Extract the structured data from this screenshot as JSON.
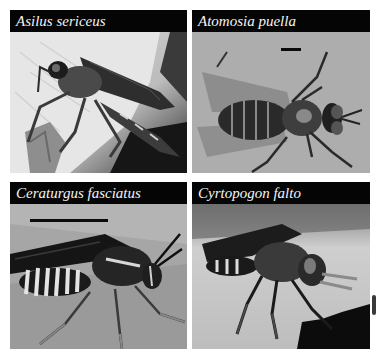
{
  "figure": {
    "panels": [
      {
        "id": "asilus-sericeus",
        "title": "Asilus sericeus",
        "subject": "robber fly perched on leaf edge, side view",
        "scale_bar": false,
        "background": "pale leaf with dark shadow"
      },
      {
        "id": "atomosia-puella",
        "title": "Atomosia puella",
        "subject": "robber fly, dorsal view",
        "scale_bar": true,
        "background": "grey textured surface"
      },
      {
        "id": "ceraturgus-fasciatus",
        "title": "Ceraturgus fasciatus",
        "subject": "wasp-mimic robber fly with banded abdomen, side view",
        "scale_bar": true,
        "background": "grey leaf"
      },
      {
        "id": "cyrtopogon-falto",
        "title": "Cyrtopogon falto",
        "subject": "hairy robber fly on leaf, side view",
        "scale_bar": false,
        "background": "pale leaf, dark corner bottom-right"
      }
    ],
    "colors": {
      "title_bar": "#050505",
      "title_text": "#f4f4f4",
      "page_background": "#ffffff"
    }
  }
}
